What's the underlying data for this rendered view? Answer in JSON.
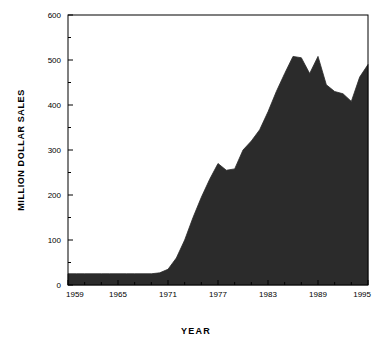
{
  "chart_data": {
    "type": "area",
    "title": "",
    "xlabel": "YEAR",
    "ylabel": "MILLION DOLLAR SALES",
    "xlim": [
      1959,
      1995
    ],
    "ylim": [
      0,
      600
    ],
    "grid": false,
    "legend": "none",
    "fill_color": "#2b2b2b",
    "axis_color": "#000000",
    "background": "#ffffff",
    "x_tick_labels": [
      "1959",
      "1965",
      "1971",
      "1977",
      "1983",
      "1989",
      "1995"
    ],
    "x_tick_values": [
      1959,
      1965,
      1971,
      1977,
      1983,
      1989,
      1995
    ],
    "x_minor_interval": 2,
    "y_tick_labels": [
      "0",
      "100",
      "200",
      "300",
      "400",
      "500",
      "600"
    ],
    "y_tick_values": [
      0,
      100,
      200,
      300,
      400,
      500,
      600
    ],
    "y_minor_interval": 50,
    "x": [
      1959,
      1960,
      1961,
      1962,
      1963,
      1964,
      1965,
      1966,
      1967,
      1968,
      1969,
      1970,
      1971,
      1972,
      1973,
      1974,
      1975,
      1976,
      1977,
      1978,
      1979,
      1980,
      1981,
      1982,
      1983,
      1984,
      1985,
      1986,
      1987,
      1988,
      1989,
      1990,
      1991,
      1992,
      1993,
      1994,
      1995
    ],
    "values": [
      25,
      25,
      25,
      25,
      25,
      25,
      25,
      25,
      25,
      25,
      25,
      27,
      35,
      60,
      100,
      150,
      195,
      235,
      270,
      255,
      258,
      300,
      320,
      345,
      385,
      430,
      470,
      508,
      505,
      470,
      508,
      445,
      430,
      425,
      408,
      462,
      490
    ],
    "series": [
      {
        "name": "Million Dollar Sales",
        "values": [
          25,
          25,
          25,
          25,
          25,
          25,
          25,
          25,
          25,
          25,
          25,
          27,
          35,
          60,
          100,
          150,
          195,
          235,
          270,
          255,
          258,
          300,
          320,
          345,
          385,
          430,
          470,
          508,
          505,
          470,
          508,
          445,
          430,
          425,
          408,
          462,
          490
        ]
      }
    ]
  }
}
